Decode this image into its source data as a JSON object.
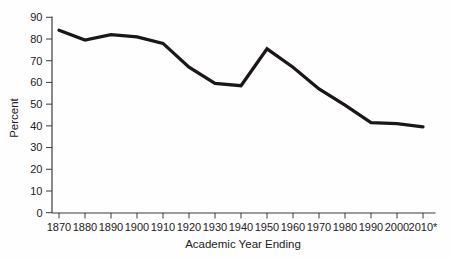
{
  "chart_data": {
    "type": "line",
    "title": "",
    "xlabel": "Academic Year Ending",
    "ylabel": "Percent",
    "categories": [
      "1870",
      "1880",
      "1890",
      "1900",
      "1910",
      "1920",
      "1930",
      "1940",
      "1950",
      "1960",
      "1970",
      "1980",
      "1990",
      "2000",
      "2010*"
    ],
    "values": [
      84,
      79.5,
      82,
      81,
      78,
      67,
      59.5,
      58.5,
      75.5,
      67,
      57,
      49.5,
      41.5,
      41,
      39.5
    ],
    "yticks": [
      0,
      10,
      20,
      30,
      40,
      50,
      60,
      70,
      80,
      90
    ],
    "ylim": [
      0,
      90
    ],
    "ytick_step": 10,
    "grid": false,
    "legend": null,
    "colors": {
      "line": "#1b1718",
      "axis": "#3d3a3b",
      "text": "#242021"
    },
    "line_width": 3.3
  }
}
